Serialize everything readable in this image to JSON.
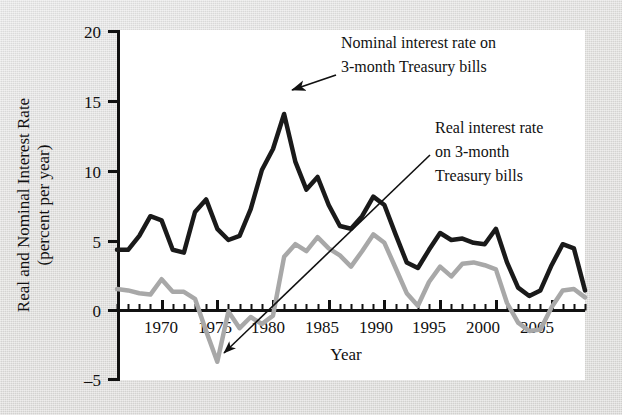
{
  "figure": {
    "background_color": "#dcdcdc",
    "plot_background_color": "#ffffff",
    "nominal_color": "#1a1a1a",
    "real_color": "#a8a8a8"
  },
  "axis": {
    "y_title_line1": "Real and Nominal Interest Rate",
    "y_title_line2": "(percent per year)",
    "x_title": "Year",
    "y_ticks": [
      "20",
      "15",
      "10",
      "5",
      "0",
      "–5"
    ],
    "x_ticks": [
      "1970",
      "1975",
      "1980",
      "1985",
      "1990",
      "1995",
      "2000",
      "2005"
    ]
  },
  "annotations": [
    {
      "name": "nominal-annotation",
      "lines": [
        "Nominal interest rate on",
        "3-month Treasury bills"
      ]
    },
    {
      "name": "real-annotation",
      "lines": [
        "Real interest rate",
        "on 3-month",
        "Treasury bills"
      ]
    }
  ],
  "chart_data": {
    "type": "line",
    "title": "",
    "xlabel": "Year",
    "ylabel": "Real and Nominal Interest Rate (percent per year)",
    "xlim": [
      1966,
      2008
    ],
    "ylim": [
      -5,
      20
    ],
    "y_ticks": [
      -5,
      0,
      5,
      10,
      15,
      20
    ],
    "x_ticks": [
      1970,
      1975,
      1980,
      1985,
      1990,
      1995,
      2000,
      2005
    ],
    "x_minor_tick_interval": 1,
    "grid": false,
    "legend": "annotations-with-arrows",
    "x": [
      1966,
      1967,
      1968,
      1969,
      1970,
      1971,
      1972,
      1973,
      1974,
      1975,
      1976,
      1977,
      1978,
      1979,
      1980,
      1981,
      1982,
      1983,
      1984,
      1985,
      1986,
      1987,
      1988,
      1989,
      1990,
      1991,
      1992,
      1993,
      1994,
      1995,
      1996,
      1997,
      1998,
      1999,
      2000,
      2001,
      2002,
      2003,
      2004,
      2005,
      2006,
      2007,
      2008
    ],
    "series": [
      {
        "name": "Nominal interest rate on 3-month Treasury bills",
        "color": "#1a1a1a",
        "values": [
          4.3,
          4.3,
          5.3,
          6.7,
          6.4,
          4.3,
          4.1,
          7.0,
          7.9,
          5.8,
          5.0,
          5.3,
          7.2,
          10.0,
          11.5,
          14.0,
          10.6,
          8.6,
          9.5,
          7.5,
          6.0,
          5.8,
          6.7,
          8.1,
          7.5,
          5.4,
          3.4,
          3.0,
          4.3,
          5.5,
          5.0,
          5.1,
          4.8,
          4.7,
          5.8,
          3.4,
          1.6,
          1.0,
          1.4,
          3.2,
          4.7,
          4.4,
          1.4
        ]
      },
      {
        "name": "Real interest rate on 3-month Treasury bills",
        "color": "#a8a8a8",
        "values": [
          1.5,
          1.4,
          1.2,
          1.1,
          2.2,
          1.3,
          1.3,
          0.8,
          -1.5,
          -3.7,
          -0.1,
          -1.3,
          -0.5,
          -1.0,
          -0.4,
          3.8,
          4.7,
          4.2,
          5.2,
          4.4,
          3.9,
          3.1,
          4.2,
          5.4,
          4.8,
          3.0,
          1.2,
          0.3,
          2.0,
          3.1,
          2.4,
          3.3,
          3.4,
          3.2,
          2.9,
          0.5,
          -0.9,
          -1.5,
          -1.4,
          0.2,
          1.4,
          1.5,
          0.9
        ]
      }
    ]
  }
}
